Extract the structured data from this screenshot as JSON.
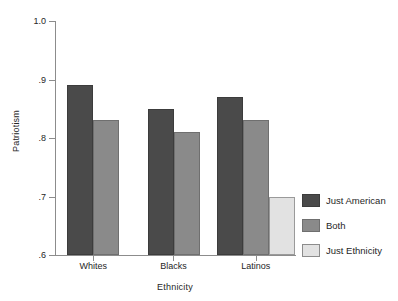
{
  "chart_data": {
    "type": "bar",
    "title": "",
    "xlabel": "Ethnicity",
    "ylabel": "Patriotism",
    "categories": [
      "Whites",
      "Blacks",
      "Latinos"
    ],
    "series": [
      {
        "name": "Just American",
        "color": "#4a4a4a",
        "values": [
          0.89,
          0.85,
          0.87
        ]
      },
      {
        "name": "Both",
        "color": "#8a8a8a",
        "values": [
          0.83,
          0.81,
          0.83
        ]
      },
      {
        "name": "Just Ethnicity",
        "color": "#e2e2e2",
        "values": [
          null,
          null,
          0.7
        ]
      }
    ],
    "ylim": [
      0.6,
      1.0
    ],
    "yticks": [
      1.0,
      0.9,
      0.8,
      0.7,
      0.6
    ],
    "ytick_labels": [
      "1.0",
      ".9",
      ".8",
      ".7",
      ".6"
    ],
    "grid": false,
    "legend_position": "right"
  }
}
